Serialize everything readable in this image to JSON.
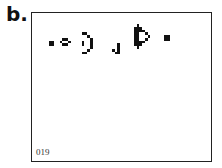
{
  "panel": {
    "label": "b."
  },
  "board": {
    "generation": "019",
    "cell_size": 2.75,
    "cell_color": "#111111",
    "cells": [
      [
        6,
        10
      ],
      [
        7,
        10
      ],
      [
        6,
        11
      ],
      [
        7,
        11
      ],
      [
        10,
        10
      ],
      [
        11,
        9
      ],
      [
        12,
        9
      ],
      [
        13,
        10
      ],
      [
        11,
        11
      ],
      [
        12,
        11
      ],
      [
        18,
        7
      ],
      [
        19,
        7
      ],
      [
        20,
        8
      ],
      [
        21,
        9
      ],
      [
        21,
        10
      ],
      [
        21,
        11
      ],
      [
        21,
        12
      ],
      [
        18,
        10
      ],
      [
        18,
        11
      ],
      [
        20,
        13
      ],
      [
        18,
        14
      ],
      [
        19,
        14
      ],
      [
        29,
        13
      ],
      [
        31,
        13
      ],
      [
        31,
        12
      ],
      [
        31,
        11
      ],
      [
        30,
        14
      ],
      [
        31,
        14
      ],
      [
        38,
        4
      ],
      [
        37,
        5
      ],
      [
        38,
        5
      ],
      [
        39,
        5
      ],
      [
        37,
        6
      ],
      [
        38,
        6
      ],
      [
        39,
        6
      ],
      [
        40,
        6
      ],
      [
        37,
        7
      ],
      [
        38,
        7
      ],
      [
        41,
        7
      ],
      [
        37,
        8
      ],
      [
        38,
        8
      ],
      [
        42,
        8
      ],
      [
        37,
        9
      ],
      [
        38,
        9
      ],
      [
        41,
        9
      ],
      [
        37,
        10
      ],
      [
        38,
        10
      ],
      [
        39,
        10
      ],
      [
        40,
        10
      ],
      [
        37,
        11
      ],
      [
        38,
        11
      ],
      [
        39,
        11
      ],
      [
        38,
        12
      ],
      [
        48,
        8
      ],
      [
        49,
        8
      ],
      [
        48,
        9
      ],
      [
        49,
        9
      ]
    ]
  }
}
